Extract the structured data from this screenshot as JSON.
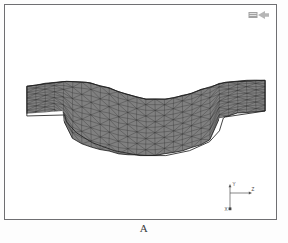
{
  "figure": {
    "caption": "A",
    "background_color": "#ffffff",
    "frame_color": "#6f6f72"
  },
  "watermark": {
    "icon": "software-logo-icon",
    "label": ""
  },
  "triad": {
    "name": "coordinate-triad",
    "vertical_axis_label": "Y",
    "horizontal_axis_label": "Z",
    "origin_label": "X",
    "line_color": "#555555"
  },
  "mesh": {
    "name": "deformed-beam-mesh",
    "element_type": "triangular",
    "fill_color": "#808080",
    "edge_color": "#2f2f2f",
    "outline_color": "#1f1f1f",
    "description": "Deformed curved sagging beam / plate with stepped flange ends"
  },
  "chart_data": {
    "type": "mesh-plot",
    "title": "A",
    "xlabel": "Z",
    "ylabel": "Y",
    "grid": false,
    "legend": "none",
    "series": [
      {
        "name": "deformed-mesh-outline",
        "top_profile": [
          [
            26,
            86
          ],
          [
            46,
            83
          ],
          [
            66,
            81
          ],
          [
            86,
            82
          ],
          [
            106,
            87
          ],
          [
            126,
            94
          ],
          [
            146,
            99
          ],
          [
            166,
            99
          ],
          [
            186,
            95
          ],
          [
            206,
            88
          ],
          [
            226,
            82
          ],
          [
            246,
            80
          ],
          [
            266,
            80
          ]
        ],
        "bottom_profile": [
          [
            26,
            116
          ],
          [
            46,
            113
          ],
          [
            60,
            112
          ],
          [
            62,
            113
          ],
          [
            64,
            130
          ],
          [
            70,
            138
          ],
          [
            80,
            144
          ],
          [
            100,
            150
          ],
          [
            125,
            155
          ],
          [
            150,
            156
          ],
          [
            175,
            153
          ],
          [
            196,
            147
          ],
          [
            212,
            140
          ],
          [
            218,
            131
          ],
          [
            220,
            118
          ],
          [
            240,
            113
          ],
          [
            266,
            111
          ]
        ],
        "columns": 26,
        "rows_upper": 5,
        "rows_lower": 5
      }
    ]
  }
}
